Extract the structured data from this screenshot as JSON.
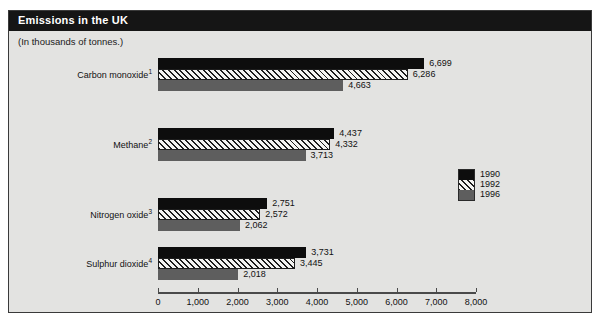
{
  "figure": {
    "title": "Emissions in the UK",
    "subtitle": "(In thousands of tonnes.)"
  },
  "legend": {
    "items": [
      {
        "label": "1990",
        "swatch": "solid-black"
      },
      {
        "label": "1992",
        "swatch": "hatched"
      },
      {
        "label": "1996",
        "swatch": "solid-gray"
      }
    ]
  },
  "chart_data": {
    "type": "bar",
    "orientation": "horizontal",
    "title": "Emissions in the UK",
    "subtitle": "(In thousands of tonnes.)",
    "xlabel": "",
    "ylabel": "",
    "xlim": [
      0,
      8000
    ],
    "xticks": [
      0,
      1000,
      2000,
      3000,
      4000,
      5000,
      6000,
      7000,
      8000
    ],
    "xtick_labels": [
      "0",
      "1,000",
      "2,000",
      "3,000",
      "4,000",
      "5,000",
      "6,000",
      "7,000",
      "8,000"
    ],
    "grid": false,
    "legend_position": "right",
    "categories": [
      "Carbon monoxide¹",
      "Methane²",
      "Nitrogen oxide³",
      "Sulphur dioxide⁴"
    ],
    "category_labels": [
      {
        "name": "Carbon monoxide",
        "footnote": "1"
      },
      {
        "name": "Methane",
        "footnote": "2"
      },
      {
        "name": "Nitrogen oxide",
        "footnote": "3"
      },
      {
        "name": "Sulphur dioxide",
        "footnote": "4"
      }
    ],
    "series": [
      {
        "name": "1990",
        "values": [
          6699,
          4437,
          2751,
          3731
        ],
        "value_labels": [
          "6,699",
          "4,437",
          "2,751",
          "3,731"
        ]
      },
      {
        "name": "1992",
        "values": [
          6286,
          4332,
          2572,
          3445
        ],
        "value_labels": [
          "6,286",
          "4,332",
          "2,572",
          "3,445"
        ]
      },
      {
        "name": "1996",
        "values": [
          4663,
          3713,
          2062,
          2018
        ],
        "value_labels": [
          "4,663",
          "3,713",
          "2,062",
          "2,018"
        ]
      }
    ]
  }
}
